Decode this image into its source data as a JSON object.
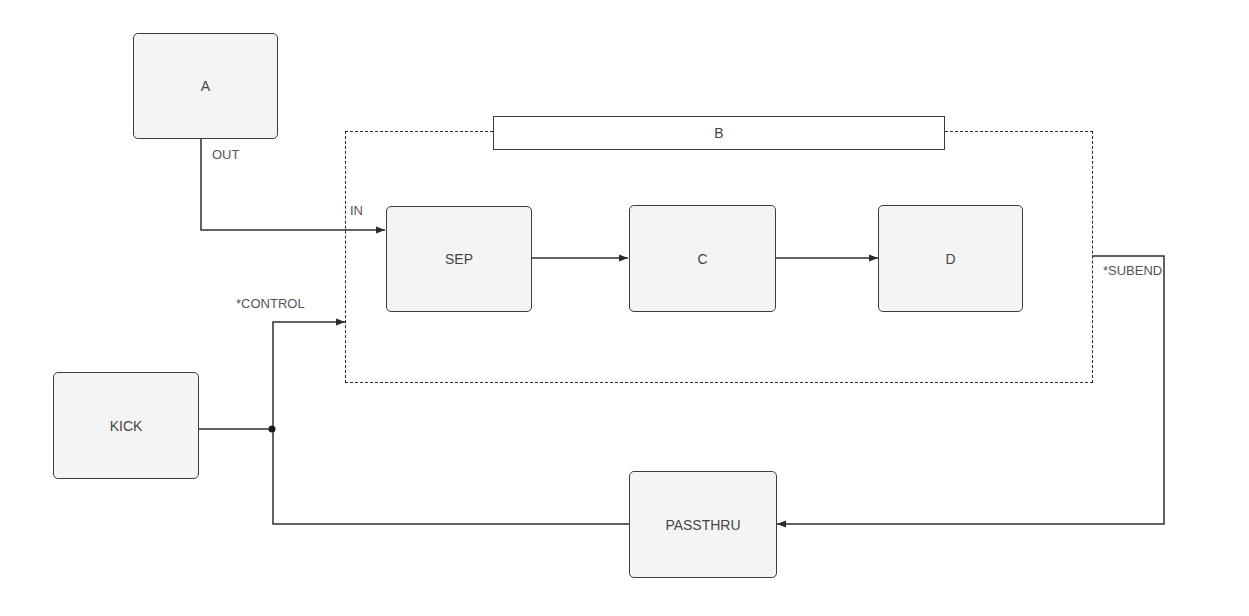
{
  "diagram": {
    "nodes": {
      "a": {
        "label": "A"
      },
      "sep": {
        "label": "SEP"
      },
      "c": {
        "label": "C"
      },
      "d": {
        "label": "D"
      },
      "kick": {
        "label": "KICK"
      },
      "passthru": {
        "label": "PASSTHRU"
      }
    },
    "group": {
      "label": "B"
    },
    "ports": {
      "out": "OUT",
      "in": "IN",
      "control": "*CONTROL",
      "subend": "*SUBEND"
    },
    "connections": [
      {
        "from": "A.OUT",
        "to": "B.IN"
      },
      {
        "from": "B.IN",
        "to": "SEP"
      },
      {
        "from": "SEP",
        "to": "C"
      },
      {
        "from": "C",
        "to": "D"
      },
      {
        "from": "B.*SUBEND",
        "to": "PASSTHRU"
      },
      {
        "from": "PASSTHRU",
        "to": "B.*CONTROL"
      },
      {
        "from": "KICK",
        "to": "B.*CONTROL"
      }
    ],
    "colors": {
      "node_fill": "#f4f4f4",
      "stroke": "#3c3c3c",
      "text": "#444444"
    }
  }
}
